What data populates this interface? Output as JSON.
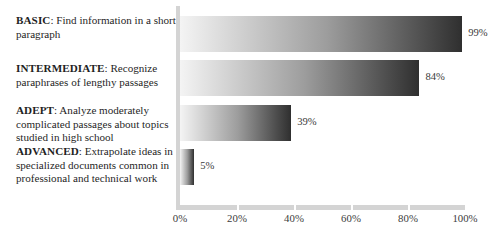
{
  "chart_data": {
    "type": "bar",
    "orientation": "horizontal",
    "title": "",
    "xlabel": "",
    "ylabel": "",
    "xlim": [
      0,
      100
    ],
    "grid": false,
    "legend": null,
    "xticklabels": [
      "0%",
      "20%",
      "40%",
      "60%",
      "80%",
      "100%"
    ],
    "xtickvalues": [
      0,
      20,
      40,
      60,
      80,
      100
    ],
    "categories": [
      "BASIC",
      "INTERMEDIATE",
      "ADEPT",
      "ADVANCED"
    ],
    "values": [
      99,
      84,
      39,
      5
    ],
    "datalabels": [
      "99%",
      "84%",
      "39%",
      "5%"
    ],
    "bar_gradient_from": "#f4f4f4",
    "bar_gradient_to": "#2f2f2f",
    "axis_color": "#d4d4d4",
    "background": "#ffffff"
  },
  "levels": [
    {
      "term": "BASIC",
      "separator": ": ",
      "description": "Find information in a short paragraph",
      "value_label": "99%"
    },
    {
      "term": "INTERMEDIATE",
      "separator": ": ",
      "description": "Recognize paraphrases of lengthy passages",
      "value_label": "84%"
    },
    {
      "term": "ADEPT",
      "separator": ": ",
      "description": "Analyze moderately complicated passages about topics studied in high school",
      "value_label": "39%"
    },
    {
      "term": "ADVANCED",
      "separator": ": ",
      "description": "Extrapolate ideas in specialized documents common in professional and technical work",
      "value_label": "5%"
    }
  ],
  "axis": {
    "ticks": [
      {
        "label": "0%"
      },
      {
        "label": "20%"
      },
      {
        "label": "40%"
      },
      {
        "label": "60%"
      },
      {
        "label": "80%"
      },
      {
        "label": "100%"
      }
    ]
  }
}
